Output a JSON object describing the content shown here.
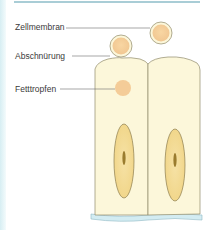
{
  "labels": {
    "zellmembran": "Zellmembran",
    "abschnuerung": "Abschnürung",
    "fetttropfen": "Fetttropfen"
  },
  "colors": {
    "cell_fill": "#fbf6d8",
    "cell_stroke": "#8f8a6a",
    "droplet_fill": "#f5cf9a",
    "droplet_stroke": "#a49a7c",
    "nucleus_fill": "#f3dc97",
    "nucleus_stroke": "#8c7d4e",
    "chromatin": "#8a6a1a",
    "basement_membrane": "#cfe9ef",
    "leader_line": "#6c6c6c"
  }
}
